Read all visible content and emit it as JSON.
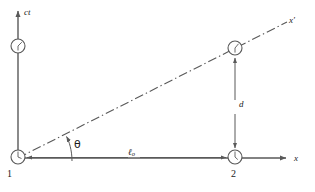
{
  "figure": {
    "type": "spacetime-diagram",
    "width": 315,
    "height": 192,
    "background_color": "#ffffff",
    "line_color": "#595959",
    "text_color": "#1a1a1a"
  },
  "axes": {
    "vertical": {
      "label": "ct",
      "name": "ct-axis",
      "x_px": 18,
      "top_px": 10,
      "bottom_px": 158
    },
    "horizontal": {
      "label": "x",
      "name": "x-axis",
      "y_px": 158,
      "left_px": 18,
      "right_px": 288
    },
    "moving": {
      "label": "x′",
      "name": "x-prime-axis",
      "style": "dash-dot",
      "from_px": [
        18,
        158
      ],
      "to_px": [
        288,
        22
      ]
    }
  },
  "annotations": {
    "angle": {
      "label": "θ",
      "name": "theta-angle",
      "between": [
        "x-axis",
        "x-prime-axis"
      ],
      "vertex_px": [
        18,
        158
      ]
    },
    "length": {
      "label": "ℓ",
      "subscript": "o",
      "name": "proper-length-l0",
      "from_px": [
        25,
        158
      ],
      "to_px": [
        228,
        158
      ],
      "arrow": "double-headed"
    },
    "separation": {
      "label": "d",
      "name": "distance-d",
      "from_px": [
        235,
        58
      ],
      "to_px": [
        235,
        148
      ],
      "arrow": "double-headed"
    }
  },
  "clocks": [
    {
      "name": "clock-on-ct-axis",
      "cx": 18,
      "cy": 46,
      "r": 7,
      "hand_angle_deg": 40,
      "label": ""
    },
    {
      "name": "clock-event-1",
      "cx": 18,
      "cy": 157,
      "r": 7,
      "hand_angle_deg": 0,
      "label": "1"
    },
    {
      "name": "clock-on-x-prime",
      "cx": 235,
      "cy": 48,
      "r": 7,
      "hand_angle_deg": 50,
      "label": ""
    },
    {
      "name": "clock-event-2",
      "cx": 235,
      "cy": 157,
      "r": 7,
      "hand_angle_deg": 10,
      "label": "2"
    }
  ],
  "labels": {
    "ct": "ct",
    "x": "x",
    "x_prime": "x′",
    "theta": "θ",
    "d": "d",
    "l_main": "ℓ",
    "l_sub": "o",
    "event_one": "1",
    "event_two": "2"
  }
}
